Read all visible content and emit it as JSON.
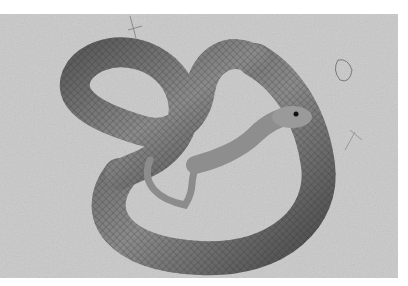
{
  "image": {
    "subject": "coiled snake on sandy ground",
    "style": "black-and-white photograph",
    "colors": {
      "border": "#ffffff",
      "ground": "#c9c9c9",
      "snake_dark": "#3a3a3a",
      "snake_mid": "#7a7a7a",
      "snake_light": "#b5b5b5"
    }
  }
}
